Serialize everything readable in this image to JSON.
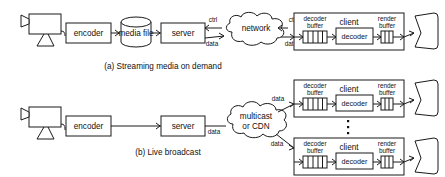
{
  "figure": {
    "stroke_color": "#1a1a1a",
    "background_color": "#ffffff",
    "panels": [
      {
        "id": "panel-a",
        "caption": "(a) Streaming media on demand",
        "nodes": {
          "camera": "camera-icon",
          "encoder": "encoder",
          "media_file": "media file",
          "server": "server",
          "network": "network",
          "client": "client",
          "decoder_buffer": "decoder\nbuffer",
          "decoder": "decoder",
          "render_buffer": "render\nbuffer",
          "display": "display-icon"
        },
        "labels": {
          "encoder": "encoder",
          "media_file": "media file",
          "server": "server",
          "cloud": "network",
          "client": "client",
          "decoder_buffer_line1": "decoder",
          "decoder_buffer_line2": "buffer",
          "decoder": "decoder",
          "render_buffer_line1": "render",
          "render_buffer_line2": "buffer",
          "ctrl_left": "ctrl",
          "data_left": "data",
          "ctrl_right": "ctrl",
          "data_right": "data"
        }
      },
      {
        "id": "panel-b",
        "caption": "(b) Live broadcast",
        "nodes": {
          "camera": "camera-icon",
          "encoder": "encoder",
          "server": "server",
          "cloud": "multicast or CDN",
          "ellipsis": "vertical-ellipsis-icon"
        },
        "labels": {
          "encoder": "encoder",
          "server": "server",
          "cloud_line1": "multicast",
          "cloud_line2": "or CDN",
          "data_server": "data",
          "data_top_client": "data",
          "data_bottom_client": "data",
          "client": "client",
          "decoder_buffer_line1": "decoder",
          "decoder_buffer_line2": "buffer",
          "decoder": "decoder",
          "render_buffer_line1": "render",
          "render_buffer_line2": "buffer"
        },
        "clients": [
          {
            "id": "client-top",
            "client": "client",
            "decoder_buffer_line1": "decoder",
            "decoder_buffer_line2": "buffer",
            "decoder": "decoder",
            "render_buffer_line1": "render",
            "render_buffer_line2": "buffer"
          },
          {
            "id": "client-bottom",
            "client": "client",
            "decoder_buffer_line1": "decoder",
            "decoder_buffer_line2": "buffer",
            "decoder": "decoder",
            "render_buffer_line1": "render",
            "render_buffer_line2": "buffer"
          }
        ]
      }
    ]
  }
}
